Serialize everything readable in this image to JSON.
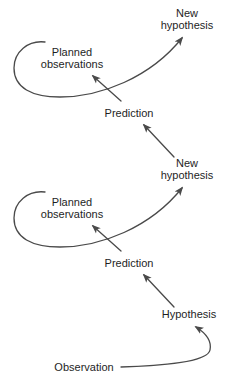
{
  "diagram": {
    "title": "",
    "nodes": [
      {
        "id": "new_hypothesis_top",
        "lines": [
          "New",
          "hypothesis"
        ]
      },
      {
        "id": "planned_observations_top",
        "lines": [
          "Planned",
          "observations"
        ]
      },
      {
        "id": "prediction_top",
        "lines": [
          "Prediction"
        ]
      },
      {
        "id": "new_hypothesis_mid",
        "lines": [
          "New",
          "hypothesis"
        ]
      },
      {
        "id": "planned_observations_mid",
        "lines": [
          "Planned",
          "observations"
        ]
      },
      {
        "id": "prediction_mid",
        "lines": [
          "Prediction"
        ]
      },
      {
        "id": "hypothesis",
        "lines": [
          "Hypothesis"
        ]
      },
      {
        "id": "observation",
        "lines": [
          "Observation"
        ]
      }
    ],
    "edges": [
      {
        "from": "observation",
        "to": "hypothesis",
        "style": "curved"
      },
      {
        "from": "hypothesis",
        "to": "prediction_mid",
        "style": "straight"
      },
      {
        "from": "prediction_mid",
        "to": "planned_observations_mid",
        "style": "straight"
      },
      {
        "from": "planned_observations_mid",
        "to": "new_hypothesis_mid",
        "style": "loop"
      },
      {
        "from": "new_hypothesis_mid",
        "to": "prediction_top",
        "style": "straight"
      },
      {
        "from": "prediction_top",
        "to": "planned_observations_top",
        "style": "straight"
      },
      {
        "from": "planned_observations_top",
        "to": "new_hypothesis_top",
        "style": "loop"
      }
    ],
    "colors": {
      "line": "#4a4a4a",
      "text": "#1e1e1e",
      "background": "#ffffff"
    }
  }
}
